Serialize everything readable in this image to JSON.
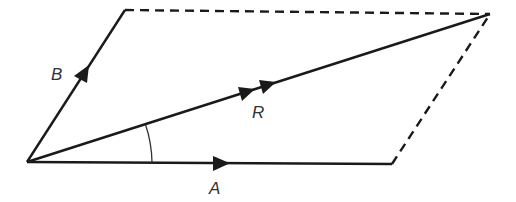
{
  "diagram": {
    "type": "parallelogram-of-vectors",
    "colors": {
      "line": "#1a1a1a",
      "label": "#333333",
      "background": "#ffffff"
    },
    "vectors": [
      {
        "id": "A",
        "label": "A",
        "from": [
          27,
          162
        ],
        "to": [
          392,
          164
        ],
        "arrowheads": 1
      },
      {
        "id": "B",
        "label": "B",
        "from": [
          27,
          162
        ],
        "to": [
          125,
          10
        ],
        "arrowheads": 1
      },
      {
        "id": "R",
        "label": "R",
        "from": [
          27,
          162
        ],
        "to": [
          490,
          14
        ],
        "arrowheads": 2
      }
    ],
    "dashed_sides": [
      {
        "from": [
          125,
          10
        ],
        "to": [
          490,
          14
        ]
      },
      {
        "from": [
          392,
          164
        ],
        "to": [
          490,
          14
        ]
      }
    ],
    "angle_arc": {
      "between": [
        "A",
        "R"
      ],
      "vertex": [
        27,
        162
      ],
      "radius": 125
    },
    "labels": {
      "A": "A",
      "B": "B",
      "R": "R"
    }
  }
}
